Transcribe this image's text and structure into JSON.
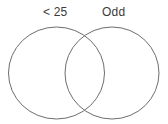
{
  "figure": {
    "type": "venn-diagram",
    "set_count": 2,
    "background_color": "#ffffff",
    "stroke_color": "#6e6e6e",
    "fill_color": "#ffffff",
    "stroke_width": 1
  },
  "sets": [
    {
      "id": "left",
      "label": "< 25",
      "label_x": 58,
      "label_y": 13,
      "center_x": 56.5,
      "center_y": 73,
      "radius_x": 48,
      "radius_y": 46
    },
    {
      "id": "right",
      "label": "Odd",
      "label_x": 115,
      "label_y": 13,
      "center_x": 112,
      "center_y": 73,
      "radius_x": 47,
      "radius_y": 46
    }
  ],
  "regions": {
    "left_only": "",
    "intersection": "",
    "right_only": ""
  }
}
